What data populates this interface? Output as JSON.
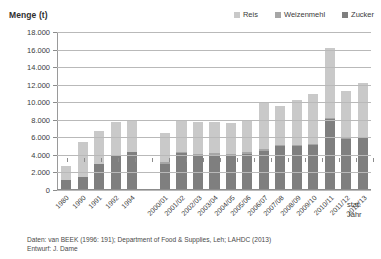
{
  "chart_data": {
    "type": "bar",
    "stacked": true,
    "title": "Menge (t)",
    "ylabel": "Menge (t)",
    "xlabel": "stat. Jahr",
    "ylim": [
      0,
      18000
    ],
    "ytick_step": 2000,
    "grid": true,
    "legend_position": "top-right",
    "yticks": [
      "18.000",
      "16.000",
      "14.000",
      "12.000",
      "10.000",
      "8.000",
      "6.000",
      "4.000",
      "2.000",
      "0"
    ],
    "ytick_values": [
      18000,
      16000,
      14000,
      12000,
      10000,
      8000,
      6000,
      4000,
      2000,
      0
    ],
    "categories": [
      "1980",
      "1990",
      "1991",
      "1992",
      "1994",
      "",
      "2000/01",
      "2001/02",
      "2002/03",
      "2003/04",
      "2004/05",
      "2005/06",
      "2006/07",
      "2007/08",
      "2008/09",
      "2009/10",
      "2010/11",
      "2011/12",
      "2012/13"
    ],
    "series": [
      {
        "name": "Zucker",
        "color": "#7f7f7f",
        "values": [
          1000,
          1400,
          2900,
          3900,
          4300,
          null,
          2900,
          4100,
          3800,
          3900,
          3800,
          4000,
          4400,
          4900,
          4900,
          5000,
          8000,
          5700,
          5800
        ]
      },
      {
        "name": "Weizenmehl",
        "color": "#a6a6a6",
        "values": [
          0,
          0,
          0,
          0,
          0,
          null,
          200,
          200,
          200,
          200,
          200,
          200,
          200,
          200,
          200,
          200,
          200,
          200,
          200
        ]
      },
      {
        "name": "Reis",
        "color": "#c9c9c9",
        "values": [
          1600,
          4000,
          3800,
          3800,
          3500,
          null,
          3300,
          3500,
          3700,
          3600,
          3600,
          3700,
          5300,
          4400,
          5100,
          5700,
          8000,
          5300,
          6200
        ]
      }
    ],
    "totals": [
      2600,
      5400,
      6700,
      7700,
      7800,
      null,
      6400,
      7800,
      7700,
      7700,
      7600,
      7900,
      9900,
      9500,
      10200,
      10900,
      16200,
      11200,
      12200
    ]
  },
  "legend": {
    "items": [
      {
        "label": "Reis",
        "color": "#c9c9c9"
      },
      {
        "label": "Weizenmehl",
        "color": "#a6a6a6"
      },
      {
        "label": "Zucker",
        "color": "#7f7f7f"
      }
    ]
  },
  "footer": {
    "line1": "Daten: van BEEK (1996: 191); Department of Food & Supplies, Leh; LAHDC (2013)",
    "line2": "Entwurf: J. Dame"
  },
  "axis_title": {
    "x_line1": "stat.",
    "x_line2": "Jahr"
  }
}
